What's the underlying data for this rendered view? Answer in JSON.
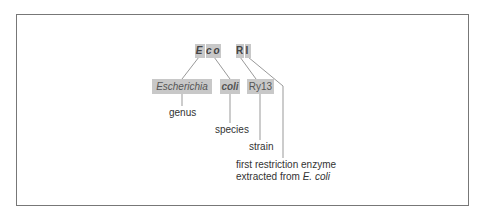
{
  "diagram": {
    "abbrev": {
      "e": "E",
      "co": "co",
      "r": "R",
      "i": "I"
    },
    "full": {
      "genus_name": "Escherichia",
      "species_name": "coli",
      "strain_name": "Ry13"
    },
    "labels": {
      "genus": "genus",
      "species": "species",
      "strain": "strain",
      "enzyme_line1": "first restriction enzyme",
      "enzyme_line2_prefix": "extracted from ",
      "enzyme_line2_italic": "E. coli"
    },
    "colors": {
      "box_fill": "#c8c8c8",
      "line": "#999999",
      "frame": "#777777"
    }
  }
}
